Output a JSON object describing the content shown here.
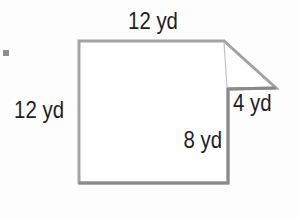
{
  "figure": {
    "type": "geometry-diagram",
    "labels": {
      "top_side": "12 yd",
      "left_side": "12 yd",
      "right_lower_side": "8 yd",
      "flap_side": "4 yd"
    },
    "measurements": [
      {
        "side": "top",
        "value": 12,
        "unit": "yd"
      },
      {
        "side": "left",
        "value": 12,
        "unit": "yd"
      },
      {
        "side": "right-lower",
        "value": 8,
        "unit": "yd"
      },
      {
        "side": "flap",
        "value": 4,
        "unit": "yd"
      }
    ],
    "colors": {
      "outline": "#a3a3a3",
      "outline_dark": "#8a8a8a",
      "crease": "#c2c2c2",
      "text": "#1f1f1f",
      "background": "#fdfdfd",
      "bullet": "#8f8f8f",
      "fill": "#ffffff"
    }
  }
}
